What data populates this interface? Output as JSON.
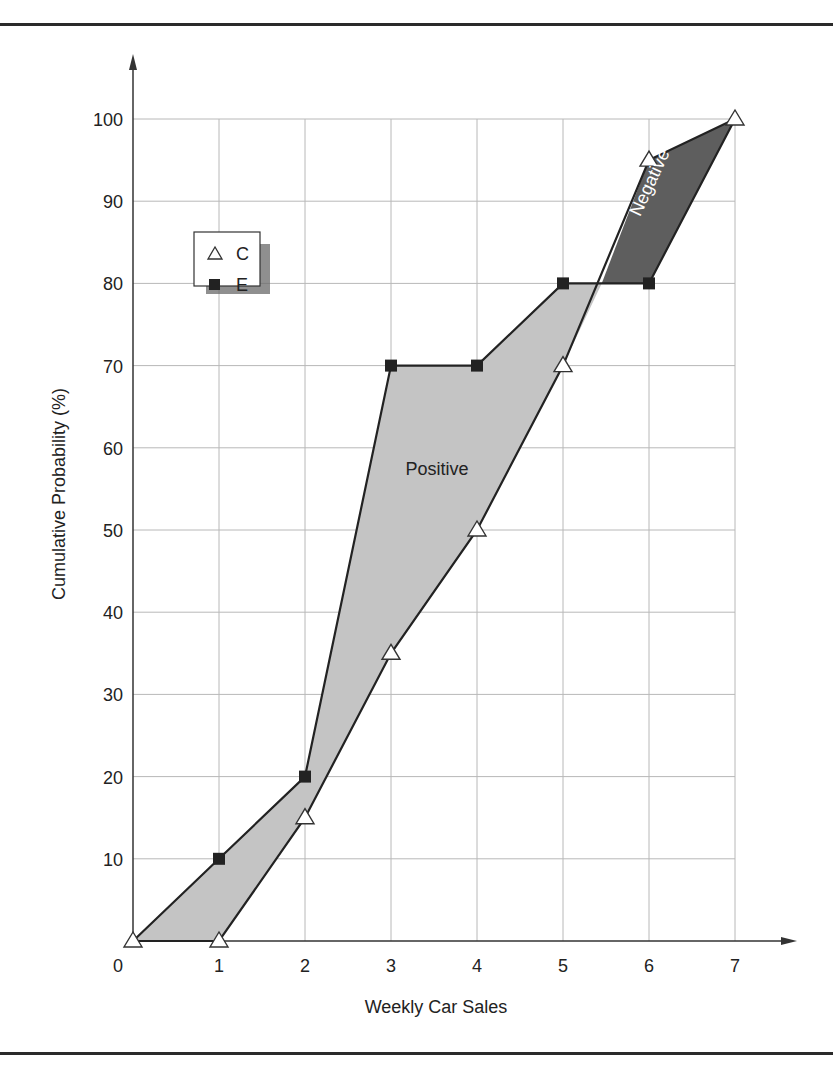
{
  "chart_data": {
    "type": "line",
    "title": "",
    "xlabel": "Weekly Car Sales",
    "ylabel": "Cumulative Probability (%)",
    "x_ticks": [
      "0",
      "1",
      "2",
      "3",
      "4",
      "5",
      "6",
      "7"
    ],
    "y_ticks": [
      "10",
      "20",
      "30",
      "40",
      "50",
      "60",
      "70",
      "80",
      "90",
      "100"
    ],
    "xlim": [
      0,
      7
    ],
    "ylim": [
      0,
      100
    ],
    "grid": true,
    "legend_position": "upper-left",
    "series": [
      {
        "name": "C",
        "marker": "open-triangle",
        "x": [
          0,
          1,
          2,
          3,
          4,
          5,
          6,
          7
        ],
        "values": [
          0,
          0,
          15,
          35,
          50,
          70,
          95,
          100
        ]
      },
      {
        "name": "E",
        "marker": "filled-square",
        "x": [
          1,
          2,
          3,
          4,
          5,
          6
        ],
        "values": [
          10,
          20,
          70,
          70,
          80,
          80
        ]
      }
    ],
    "annotations": [
      {
        "text": "Positive",
        "region": "area where E is above C",
        "fill": "#c4c4c4"
      },
      {
        "text": "Negative",
        "region": "area where C is above E",
        "fill": "#5e5e5e"
      }
    ]
  },
  "legend": {
    "items": [
      {
        "label": "C"
      },
      {
        "label": "E"
      }
    ]
  },
  "labels": {
    "positive": "Positive",
    "negative": "Negative",
    "xlabel": "Weekly Car Sales",
    "ylabel": "Cumulative Probability (%)",
    "origin": "0"
  },
  "colors": {
    "positive_fill": "#c4c4c4",
    "negative_fill": "#5e5e5e",
    "grid": "#b8b8b8",
    "line": "#222222"
  }
}
